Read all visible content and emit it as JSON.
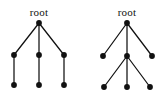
{
  "figure": {
    "title": "",
    "background_color": "#ffffff",
    "node_color": "#111111",
    "edge_color": "#111111",
    "label_color": "#111111",
    "node_radius": 2.9,
    "edge_width": 1.25,
    "label_font_size": 11
  },
  "trees": [
    {
      "id": "left-tree",
      "name": "left-tree",
      "label": "root",
      "label_position": {
        "x": 39,
        "y": 16
      },
      "description": "root with three children, each child has one child",
      "nodes": [
        {
          "id": "L-root",
          "name": "root-node",
          "x": 39,
          "y": 23,
          "depth": 0
        },
        {
          "id": "L-c1",
          "name": "child-node-1",
          "x": 14,
          "y": 55,
          "depth": 1
        },
        {
          "id": "L-c2",
          "name": "child-node-2",
          "x": 39,
          "y": 55,
          "depth": 1
        },
        {
          "id": "L-c3",
          "name": "child-node-3",
          "x": 64,
          "y": 55,
          "depth": 1
        },
        {
          "id": "L-g1",
          "name": "grandchild-node-1",
          "x": 14,
          "y": 85,
          "depth": 2
        },
        {
          "id": "L-g2",
          "name": "grandchild-node-2",
          "x": 39,
          "y": 85,
          "depth": 2
        },
        {
          "id": "L-g3",
          "name": "grandchild-node-3",
          "x": 64,
          "y": 85,
          "depth": 2
        }
      ],
      "edges": [
        {
          "from": "L-root",
          "to": "L-c1"
        },
        {
          "from": "L-root",
          "to": "L-c2"
        },
        {
          "from": "L-root",
          "to": "L-c3"
        },
        {
          "from": "L-c1",
          "to": "L-g1"
        },
        {
          "from": "L-c2",
          "to": "L-g2"
        },
        {
          "from": "L-c3",
          "to": "L-g3"
        }
      ]
    },
    {
      "id": "right-tree",
      "name": "right-tree",
      "label": "root",
      "label_position": {
        "x": 127,
        "y": 16
      },
      "description": "root with three children, middle child has three children",
      "nodes": [
        {
          "id": "R-root",
          "name": "root-node",
          "x": 127,
          "y": 23,
          "depth": 0
        },
        {
          "id": "R-c1",
          "name": "child-node-1",
          "x": 103,
          "y": 56,
          "depth": 1
        },
        {
          "id": "R-c2",
          "name": "child-node-2",
          "x": 127,
          "y": 56,
          "depth": 1
        },
        {
          "id": "R-c3",
          "name": "child-node-3",
          "x": 152,
          "y": 56,
          "depth": 1
        },
        {
          "id": "R-g1",
          "name": "grandchild-node-1",
          "x": 104,
          "y": 87,
          "depth": 2
        },
        {
          "id": "R-g2",
          "name": "grandchild-node-2",
          "x": 127,
          "y": 87,
          "depth": 2
        },
        {
          "id": "R-g3",
          "name": "grandchild-node-3",
          "x": 150,
          "y": 87,
          "depth": 2
        }
      ],
      "edges": [
        {
          "from": "R-root",
          "to": "R-c1"
        },
        {
          "from": "R-root",
          "to": "R-c2"
        },
        {
          "from": "R-root",
          "to": "R-c3"
        },
        {
          "from": "R-c2",
          "to": "R-g1"
        },
        {
          "from": "R-c2",
          "to": "R-g2"
        },
        {
          "from": "R-c2",
          "to": "R-g3"
        }
      ]
    }
  ]
}
